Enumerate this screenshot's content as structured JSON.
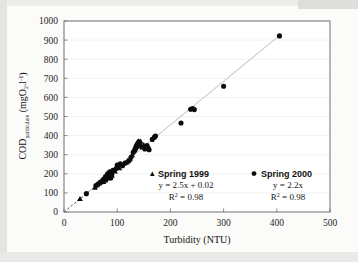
{
  "chart_data": {
    "type": "scatter",
    "title": "",
    "xlabel": "Turbidity (NTU)",
    "ylabel": "COD_particulate (mgO2.l-1)",
    "ylabel_main": "COD",
    "ylabel_sub": "particulate",
    "ylabel_unit_open": " (mgO",
    "ylabel_unit_sub": "2",
    "ylabel_unit_mid": ".l",
    "ylabel_unit_sup": "-1",
    "ylabel_unit_close": ")",
    "xlim": [
      0,
      500
    ],
    "ylim": [
      0,
      1000
    ],
    "xticks": [
      0,
      100,
      200,
      300,
      400,
      500
    ],
    "yticks": [
      0,
      100,
      200,
      300,
      400,
      500,
      600,
      700,
      800,
      900,
      1000
    ],
    "xtick_labels": [
      "0",
      "100",
      "200",
      "300",
      "400",
      "500"
    ],
    "ytick_labels": [
      "0",
      "100",
      "200",
      "300",
      "400",
      "500",
      "600",
      "700",
      "800",
      "900",
      "1000"
    ],
    "grid": true,
    "legend_position": "inside-lower-center",
    "marker_color": "#0b0b0b",
    "trendline_color": "#c9c9c9",
    "gridline_color": "#e8e8e8",
    "frame_color": "#6e6e6e",
    "background_color": "#fbfbfa",
    "trendline": {
      "x0": 0,
      "y0": 0,
      "x1": 410,
      "y1": 935
    },
    "series": [
      {
        "name": "Spring 1999",
        "marker": "triangle",
        "equation": "y = 2.5x + 0.02",
        "r_squared_label": "R",
        "r_squared_sup": "2",
        "r_squared_value": " = 0.98",
        "slope": 2.5,
        "intercept": 0.02,
        "r2": 0.98,
        "points": [
          [
            30,
            70
          ],
          [
            58,
            130
          ],
          [
            62,
            142
          ],
          [
            66,
            152
          ],
          [
            70,
            165
          ],
          [
            72,
            172
          ],
          [
            74,
            160
          ],
          [
            76,
            180
          ],
          [
            78,
            168
          ],
          [
            80,
            190
          ],
          [
            82,
            178
          ],
          [
            84,
            196
          ],
          [
            86,
            185
          ],
          [
            88,
            205
          ],
          [
            90,
            192
          ],
          [
            96,
            215
          ],
          [
            100,
            240
          ],
          [
            102,
            248
          ],
          [
            104,
            232
          ],
          [
            112,
            255
          ],
          [
            118,
            262
          ],
          [
            120,
            270
          ],
          [
            124,
            278
          ],
          [
            128,
            300
          ],
          [
            132,
            330
          ],
          [
            134,
            345
          ],
          [
            136,
            358
          ],
          [
            138,
            366
          ],
          [
            140,
            372
          ],
          [
            142,
            362
          ],
          [
            144,
            370
          ],
          [
            150,
            352
          ]
        ]
      },
      {
        "name": "Spring 2000",
        "marker": "circle",
        "equation": "y = 2.2x",
        "r_squared_label": "R",
        "r_squared_sup": "2",
        "r_squared_value": " = 0.98",
        "slope": 2.2,
        "intercept": 0,
        "r2": 0.98,
        "points": [
          [
            42,
            96
          ],
          [
            60,
            138
          ],
          [
            64,
            146
          ],
          [
            68,
            155
          ],
          [
            72,
            158
          ],
          [
            76,
            172
          ],
          [
            78,
            186
          ],
          [
            80,
            176
          ],
          [
            82,
            200
          ],
          [
            84,
            188
          ],
          [
            86,
            210
          ],
          [
            88,
            178
          ],
          [
            90,
            198
          ],
          [
            92,
            218
          ],
          [
            98,
            228
          ],
          [
            100,
            246
          ],
          [
            106,
            252
          ],
          [
            110,
            242
          ],
          [
            116,
            258
          ],
          [
            122,
            268
          ],
          [
            126,
            286
          ],
          [
            130,
            312
          ],
          [
            133,
            322
          ],
          [
            135,
            334
          ],
          [
            137,
            342
          ],
          [
            139,
            352
          ],
          [
            141,
            368
          ],
          [
            146,
            340
          ],
          [
            152,
            330
          ],
          [
            156,
            348
          ],
          [
            158,
            336
          ],
          [
            160,
            326
          ],
          [
            166,
            380
          ],
          [
            170,
            392
          ],
          [
            172,
            398
          ],
          [
            220,
            466
          ],
          [
            238,
            538
          ],
          [
            242,
            542
          ],
          [
            245,
            536
          ],
          [
            300,
            658
          ],
          [
            405,
            922
          ]
        ]
      }
    ]
  },
  "legend": {
    "entries": [
      {
        "marker_name": "triangle-marker",
        "label": "Spring 1999",
        "equation": "y = 2.5x + 0.02",
        "r_label": "R",
        "r_sup": "2",
        "r_value": " = 0.98"
      },
      {
        "marker_name": "circle-marker",
        "label": "Spring 2000",
        "equation": "y = 2.2x",
        "r_label": "R",
        "r_sup": "2",
        "r_value": " = 0.98"
      }
    ]
  }
}
